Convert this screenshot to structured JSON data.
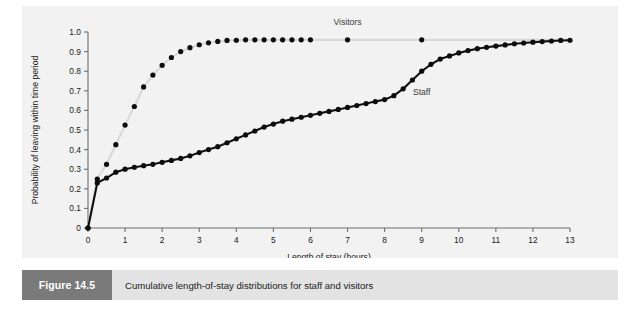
{
  "figure": {
    "badge_label": "Figure 14.5",
    "caption": "Cumulative length-of-stay distributions for staff and visitors",
    "badge_color": "#7a7a7a",
    "caption_bar_color": "#e3e3e3",
    "panel_color": "#f2f2f2"
  },
  "chart_data": {
    "type": "line",
    "title": "",
    "xlabel": "Length of stay (hours)",
    "ylabel": "Probability of leaving within time period",
    "xlim": [
      0,
      13
    ],
    "ylim": [
      0,
      1.0
    ],
    "xticks": [
      0,
      1,
      2,
      3,
      4,
      5,
      6,
      7,
      8,
      9,
      10,
      11,
      12,
      13
    ],
    "xtick_labels": [
      "0",
      "1",
      "2",
      "3",
      "4",
      "5",
      "6",
      "7",
      "8",
      "9",
      "10",
      "11",
      "12",
      "13"
    ],
    "yticks": [
      0,
      0.1,
      0.2,
      0.3,
      0.4,
      0.5,
      0.6,
      0.7,
      0.8,
      0.9,
      1.0
    ],
    "ytick_labels": [
      "0",
      "0.1",
      "0.2",
      "0.3",
      "0.4",
      "0.5",
      "0.6",
      "0.7",
      "0.8",
      "0.9",
      "1.0"
    ],
    "grid": false,
    "legend_position": "inline-annotation",
    "markers": "filled-circle",
    "series": [
      {
        "name": "Visitors",
        "color": "#d8d8d8",
        "marker_color": "#0d0d0d",
        "label_x": 7.0,
        "label_y": 1.0,
        "x": [
          0,
          0.25,
          0.5,
          0.75,
          1.0,
          1.25,
          1.5,
          1.75,
          2.0,
          2.25,
          2.5,
          2.75,
          3.0,
          3.25,
          3.5,
          3.75,
          4.0,
          4.25,
          4.5,
          4.75,
          5.0,
          5.25,
          5.5,
          5.75,
          6.0,
          7.0,
          9.0,
          13.0
        ],
        "y": [
          0,
          0.25,
          0.325,
          0.425,
          0.525,
          0.62,
          0.72,
          0.78,
          0.83,
          0.87,
          0.9,
          0.92,
          0.935,
          0.945,
          0.952,
          0.957,
          0.958,
          0.96,
          0.96,
          0.96,
          0.96,
          0.96,
          0.96,
          0.96,
          0.96,
          0.96,
          0.96,
          0.96
        ]
      },
      {
        "name": "Staff",
        "color": "#111111",
        "marker_color": "#0d0d0d",
        "label_x": 9.0,
        "label_y": 0.7,
        "x": [
          0,
          0.25,
          0.5,
          0.75,
          1.0,
          1.25,
          1.5,
          1.75,
          2.0,
          2.25,
          2.5,
          2.75,
          3.0,
          3.25,
          3.5,
          3.75,
          4.0,
          4.25,
          4.5,
          4.75,
          5.0,
          5.25,
          5.5,
          5.75,
          6.0,
          6.25,
          6.5,
          6.75,
          7.0,
          7.25,
          7.5,
          7.75,
          8.0,
          8.25,
          8.5,
          8.75,
          9.0,
          9.25,
          9.5,
          9.75,
          10.0,
          10.25,
          10.5,
          10.75,
          11.0,
          11.25,
          11.5,
          11.75,
          12.0,
          12.25,
          12.5,
          12.75,
          13.0
        ],
        "y": [
          0,
          0.23,
          0.255,
          0.285,
          0.3,
          0.31,
          0.318,
          0.325,
          0.335,
          0.345,
          0.355,
          0.368,
          0.385,
          0.4,
          0.415,
          0.435,
          0.455,
          0.475,
          0.495,
          0.515,
          0.53,
          0.545,
          0.555,
          0.565,
          0.575,
          0.585,
          0.595,
          0.605,
          0.615,
          0.625,
          0.635,
          0.645,
          0.655,
          0.675,
          0.71,
          0.755,
          0.8,
          0.835,
          0.862,
          0.878,
          0.893,
          0.905,
          0.915,
          0.922,
          0.928,
          0.934,
          0.94,
          0.944,
          0.948,
          0.951,
          0.954,
          0.957,
          0.958
        ]
      }
    ]
  }
}
